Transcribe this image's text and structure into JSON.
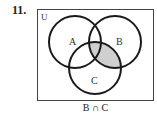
{
  "problem_number": "11.",
  "diagram": {
    "universe_label": "U",
    "sets": [
      {
        "label": "A",
        "cx": 75,
        "cy": 42,
        "r": 26
      },
      {
        "label": "B",
        "cx": 115,
        "cy": 42,
        "r": 26
      },
      {
        "label": "C",
        "cx": 95,
        "cy": 68,
        "r": 26
      }
    ],
    "shaded_region": "B ∩ C",
    "shade_color": "#cfcfcf",
    "stroke_color": "#1a1a1a"
  },
  "caption": "B ∩ C"
}
